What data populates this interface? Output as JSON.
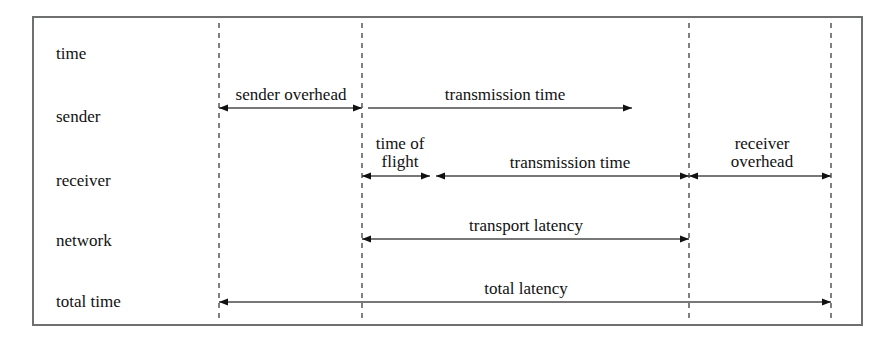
{
  "diagram": {
    "frame": {
      "x": 33,
      "y": 17,
      "width": 829,
      "height": 308
    },
    "colors": {
      "text": "#111111",
      "line": "#4a4a4a",
      "frame": "#6e7070",
      "background": "#ffffff"
    },
    "timeline_marks": [
      {
        "name": "t0-send-start",
        "x": 219
      },
      {
        "name": "t1-send-end",
        "x": 362
      },
      {
        "name": "t2-receive-end",
        "x": 689
      },
      {
        "name": "t3-total-end",
        "x": 831
      }
    ],
    "rows": [
      {
        "key": "time",
        "label": "time",
        "label_x": 56,
        "label_y": 45
      },
      {
        "key": "sender",
        "label": "sender",
        "label_x": 56,
        "label_y": 108
      },
      {
        "key": "receiver",
        "label": "receiver",
        "label_x": 56,
        "label_y": 172
      },
      {
        "key": "network",
        "label": "network",
        "label_x": 56,
        "label_y": 232
      },
      {
        "key": "total_time",
        "label": "total time",
        "label_x": 56,
        "label_y": 293
      }
    ],
    "measures": [
      {
        "key": "sender_overhead",
        "label": "sender overhead",
        "row": "sender",
        "x1": 219,
        "x2": 362,
        "y": 108,
        "arrow_start": true,
        "arrow_end": true,
        "label_x": 291,
        "label_y": 86,
        "lines": [
          "sender overhead"
        ]
      },
      {
        "key": "sender_transmission_time",
        "label": "transmission time",
        "row": "sender",
        "x1": 368,
        "x2": 632,
        "y": 108,
        "arrow_start": false,
        "arrow_end": true,
        "label_x": 505,
        "label_y": 86,
        "lines": [
          "transmission time"
        ]
      },
      {
        "key": "time_of_flight",
        "label": "time of flight",
        "row": "receiver",
        "x1": 362,
        "x2": 430,
        "y": 176,
        "arrow_start": true,
        "arrow_end": true,
        "label_x": 400,
        "label_y": 135,
        "lines": [
          "time of",
          "flight"
        ]
      },
      {
        "key": "receiver_transmission_time",
        "label": "transmission time",
        "row": "receiver",
        "x1": 436,
        "x2": 689,
        "y": 176,
        "arrow_start": true,
        "arrow_end": true,
        "label_x": 570,
        "label_y": 154,
        "lines": [
          "transmission time"
        ]
      },
      {
        "key": "receiver_overhead",
        "label": "receiver overhead",
        "row": "receiver",
        "x1": 689,
        "x2": 831,
        "y": 176,
        "arrow_start": true,
        "arrow_end": true,
        "label_x": 762,
        "label_y": 135,
        "lines": [
          "receiver",
          "overhead"
        ]
      },
      {
        "key": "transport_latency",
        "label": "transport latency",
        "row": "network",
        "x1": 362,
        "x2": 689,
        "y": 239,
        "arrow_start": true,
        "arrow_end": true,
        "label_x": 526,
        "label_y": 217,
        "lines": [
          "transport latency"
        ]
      },
      {
        "key": "total_latency",
        "label": "total latency",
        "row": "total_time",
        "x1": 219,
        "x2": 831,
        "y": 302,
        "arrow_start": true,
        "arrow_end": true,
        "label_x": 526,
        "label_y": 280,
        "lines": [
          "total latency"
        ]
      }
    ]
  }
}
